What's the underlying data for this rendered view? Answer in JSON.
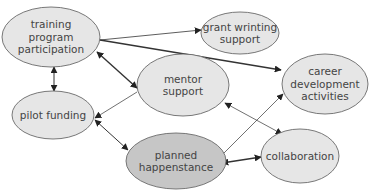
{
  "colors": {
    "node_fill": "#e6e6e6",
    "node_fill_highlight": "#c6c6c6",
    "node_stroke": "#6a6a6a",
    "edge": "#333333",
    "text": "#444444"
  },
  "nodes": [
    {
      "id": "training",
      "lines": [
        "training",
        "program",
        "participation"
      ],
      "cx": 51,
      "cy": 37,
      "rx": 49,
      "ry": 30,
      "highlight": false
    },
    {
      "id": "grant",
      "lines": [
        "grant wrinting",
        "support"
      ],
      "cx": 240,
      "cy": 33,
      "rx": 39,
      "ry": 21,
      "highlight": false
    },
    {
      "id": "career",
      "lines": [
        "career",
        "development",
        "activities"
      ],
      "cx": 325,
      "cy": 84,
      "rx": 43,
      "ry": 30,
      "highlight": false
    },
    {
      "id": "mentor",
      "lines": [
        "mentor",
        "support"
      ],
      "cx": 183,
      "cy": 85,
      "rx": 46,
      "ry": 31,
      "highlight": false
    },
    {
      "id": "pilot",
      "lines": [
        "pilot funding"
      ],
      "cx": 53,
      "cy": 115,
      "rx": 41,
      "ry": 24,
      "highlight": false
    },
    {
      "id": "planned",
      "lines": [
        "planned",
        "happenstance"
      ],
      "cx": 176,
      "cy": 161,
      "rx": 50,
      "ry": 28,
      "highlight": true
    },
    {
      "id": "collab",
      "lines": [
        "collaboration"
      ],
      "cx": 300,
      "cy": 156,
      "rx": 39,
      "ry": 27,
      "highlight": false
    }
  ],
  "edges": [
    {
      "from": "training",
      "to": "grant",
      "x1": 100,
      "y1": 40,
      "x2": 201,
      "y2": 30,
      "start_arrow": false,
      "end_arrow": true,
      "width": 0.8
    },
    {
      "from": "training",
      "to": "career",
      "x1": 100,
      "y1": 40,
      "x2": 281,
      "y2": 70,
      "start_arrow": false,
      "end_arrow": true,
      "width": 1.4
    },
    {
      "from": "training",
      "to": "mentor",
      "x1": 97,
      "y1": 52,
      "x2": 137,
      "y2": 88,
      "start_arrow": true,
      "end_arrow": true,
      "width": 1.4
    },
    {
      "from": "training",
      "to": "pilot",
      "x1": 54,
      "y1": 67,
      "x2": 54,
      "y2": 91,
      "start_arrow": true,
      "end_arrow": true,
      "width": 1.0
    },
    {
      "from": "mentor",
      "to": "pilot",
      "x1": 137,
      "y1": 92,
      "x2": 95,
      "y2": 118,
      "start_arrow": false,
      "end_arrow": true,
      "width": 0.7
    },
    {
      "from": "pilot",
      "to": "planned",
      "x1": 95,
      "y1": 120,
      "x2": 128,
      "y2": 150,
      "start_arrow": true,
      "end_arrow": true,
      "width": 1.0
    },
    {
      "from": "mentor",
      "to": "collab",
      "x1": 225,
      "y1": 103,
      "x2": 282,
      "y2": 134,
      "start_arrow": true,
      "end_arrow": true,
      "width": 0.7
    },
    {
      "from": "planned",
      "to": "career",
      "x1": 222,
      "y1": 155,
      "x2": 283,
      "y2": 94,
      "start_arrow": false,
      "end_arrow": true,
      "width": 0.7
    },
    {
      "from": "planned",
      "to": "collab",
      "x1": 222,
      "y1": 163,
      "x2": 261,
      "y2": 157,
      "start_arrow": true,
      "end_arrow": true,
      "width": 1.4
    }
  ]
}
